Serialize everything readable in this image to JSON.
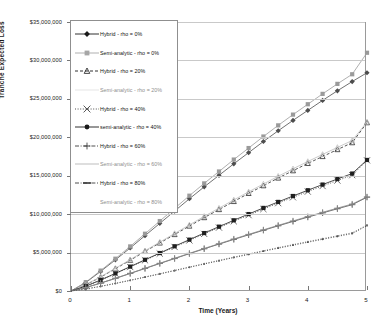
{
  "chart": {
    "title": "",
    "xlabel": "Time (Years)",
    "ylabel": "Tranche Expected Loss"
  },
  "axis": {
    "y_ticks": [
      "$0",
      "$5,000,000",
      "$10,000,000",
      "$15,000,000",
      "$20,000,000",
      "$25,000,000",
      "$30,000,000",
      "$35,000,000"
    ],
    "x_ticks": [
      "0",
      "1",
      "2",
      "3",
      "4",
      "5"
    ]
  },
  "legend": {
    "items": [
      {
        "label": "Hybrid - rho = 0%",
        "marker": "diamond",
        "line": "solid",
        "color": "#1a1a1a",
        "faint": false
      },
      {
        "label": "Semi-analytic - rho = 0%",
        "marker": "square",
        "line": "solid",
        "color": "#a6a6a6",
        "faint": false
      },
      {
        "label": "Hybrid - rho = 20%",
        "marker": "triangle",
        "line": "dashed",
        "color": "#1a1a1a",
        "faint": false
      },
      {
        "label": "Semi-analytic - rho = 20%",
        "marker": "none",
        "line": "solid",
        "color": "#e2e2e2",
        "faint": true
      },
      {
        "label": "Hybrid - rho = 40%",
        "marker": "cross",
        "line": "dotted",
        "color": "#3a3a3a",
        "faint": false
      },
      {
        "label": "semi-analytic - rho = 40%",
        "marker": "circle",
        "line": "solid",
        "color": "#1a1a1a",
        "faint": false
      },
      {
        "label": "Hybrid - rho = 60%",
        "marker": "plus",
        "line": "dashdot",
        "color": "#3a3a3a",
        "faint": false
      },
      {
        "label": "Semi-analytic - rho = 60%",
        "marker": "none",
        "line": "solid",
        "color": "#b5b5b5",
        "faint": true
      },
      {
        "label": "Hybrid - rho = 80%",
        "marker": "dash",
        "line": "dashdot",
        "color": "#3a3a3a",
        "faint": false
      },
      {
        "label": "Semi-analytic - rho = 80%",
        "marker": "none",
        "line": "none",
        "color": "#e2e2e2",
        "faint": true
      }
    ]
  },
  "chart_data": {
    "type": "line",
    "title": "",
    "xlabel": "Time (Years)",
    "ylabel": "Tranche Expected Loss",
    "xlim": [
      0,
      5
    ],
    "ylim": [
      0,
      35000000
    ],
    "ytick_step": 5000000,
    "grid": true,
    "legend_position": "upper-left",
    "x": [
      0,
      0.25,
      0.5,
      0.75,
      1,
      1.25,
      1.5,
      1.75,
      2,
      2.25,
      2.5,
      2.75,
      3,
      3.25,
      3.5,
      3.75,
      4,
      4.25,
      4.5,
      4.75,
      5
    ],
    "series": [
      {
        "name": "Hybrid - rho = 0%",
        "marker": "diamond",
        "line": "solid",
        "color": "#4d4d4d",
        "values": [
          0,
          1100000,
          2550000,
          4050000,
          5600000,
          7200000,
          8800000,
          10400000,
          12000000,
          13550000,
          15050000,
          16550000,
          18000000,
          19450000,
          20850000,
          22200000,
          23500000,
          24800000,
          26050000,
          27250000,
          28400000
        ]
      },
      {
        "name": "Semi-analytic - rho = 0%",
        "marker": "square",
        "line": "solid",
        "color": "#9a9a9a",
        "values": [
          0,
          1150000,
          2650000,
          4200000,
          5800000,
          7450000,
          9100000,
          10750000,
          12400000,
          14000000,
          15550000,
          17100000,
          18600000,
          20100000,
          21550000,
          22950000,
          24300000,
          25650000,
          26950000,
          28200000,
          31000000
        ]
      },
      {
        "name": "Hybrid - rho = 20%",
        "marker": "triangle",
        "line": "dashed",
        "color": "#2b2b2b",
        "values": [
          0,
          800000,
          1800000,
          2900000,
          4000000,
          5150000,
          6250000,
          7350000,
          8450000,
          9550000,
          10600000,
          11650000,
          12700000,
          13700000,
          14700000,
          15650000,
          16600000,
          17500000,
          18400000,
          19300000,
          21900000
        ]
      },
      {
        "name": "Semi-analytic - rho = 20%",
        "marker": "triangle",
        "line": "solid",
        "color": "#bdbdbd",
        "values": [
          0,
          820000,
          1850000,
          2960000,
          4080000,
          5240000,
          6360000,
          7480000,
          8600000,
          9710000,
          10780000,
          11850000,
          12900000,
          13920000,
          14930000,
          15900000,
          16850000,
          17770000,
          18680000,
          19580000,
          22000000
        ]
      },
      {
        "name": "Hybrid - rho = 40%",
        "marker": "cross",
        "line": "dotted",
        "color": "#555555",
        "values": [
          0,
          620000,
          1400000,
          2250000,
          3120000,
          4000000,
          4870000,
          5730000,
          6580000,
          7430000,
          8250000,
          9070000,
          9870000,
          10660000,
          11430000,
          12190000,
          12930000,
          13660000,
          14370000,
          15070000,
          17000000
        ]
      },
      {
        "name": "semi-analytic - rho = 40%",
        "marker": "square",
        "line": "solid",
        "color": "#1f1f1f",
        "values": [
          0,
          630000,
          1430000,
          2290000,
          3170000,
          4060000,
          4940000,
          5820000,
          6680000,
          7540000,
          8370000,
          9200000,
          10010000,
          10810000,
          11590000,
          12360000,
          13110000,
          13850000,
          14570000,
          15280000,
          17050000
        ]
      },
      {
        "name": "Hybrid - rho = 60%",
        "marker": "plus",
        "line": "solid",
        "color": "#4a4a4a",
        "values": [
          0,
          450000,
          1020000,
          1640000,
          2280000,
          2930000,
          3580000,
          4220000,
          4860000,
          5490000,
          6100000,
          6710000,
          7310000,
          7900000,
          8480000,
          9050000,
          9610000,
          10160000,
          10700000,
          11230000,
          12200000
        ]
      },
      {
        "name": "Semi-analytic - rho = 60%",
        "marker": "plus",
        "line": "solid",
        "color": "#8a8a8a",
        "values": [
          0,
          455000,
          1030000,
          1655000,
          2300000,
          2955000,
          3610000,
          4255000,
          4900000,
          5535000,
          6150000,
          6765000,
          7370000,
          7960000,
          8545000,
          9120000,
          9685000,
          10240000,
          10785000,
          11320000,
          12250000
        ]
      },
      {
        "name": "Hybrid - rho = 80%",
        "marker": "dot",
        "line": "dotted",
        "color": "#3a3a3a",
        "values": [
          0,
          260000,
          600000,
          980000,
          1380000,
          1800000,
          2220000,
          2650000,
          3080000,
          3510000,
          3930000,
          4350000,
          4760000,
          5170000,
          5570000,
          5960000,
          6350000,
          6730000,
          7100000,
          7470000,
          8500000
        ]
      },
      {
        "name": "Semi-analytic - rho = 80%",
        "marker": "dot",
        "line": "dotted",
        "color": "#6f6f6f",
        "values": [
          0,
          265000,
          610000,
          995000,
          1400000,
          1825000,
          2250000,
          2685000,
          3120000,
          3555000,
          3980000,
          4405000,
          4820000,
          5235000,
          5640000,
          6035000,
          6430000,
          6815000,
          7190000,
          7565000,
          8600000
        ]
      }
    ]
  }
}
